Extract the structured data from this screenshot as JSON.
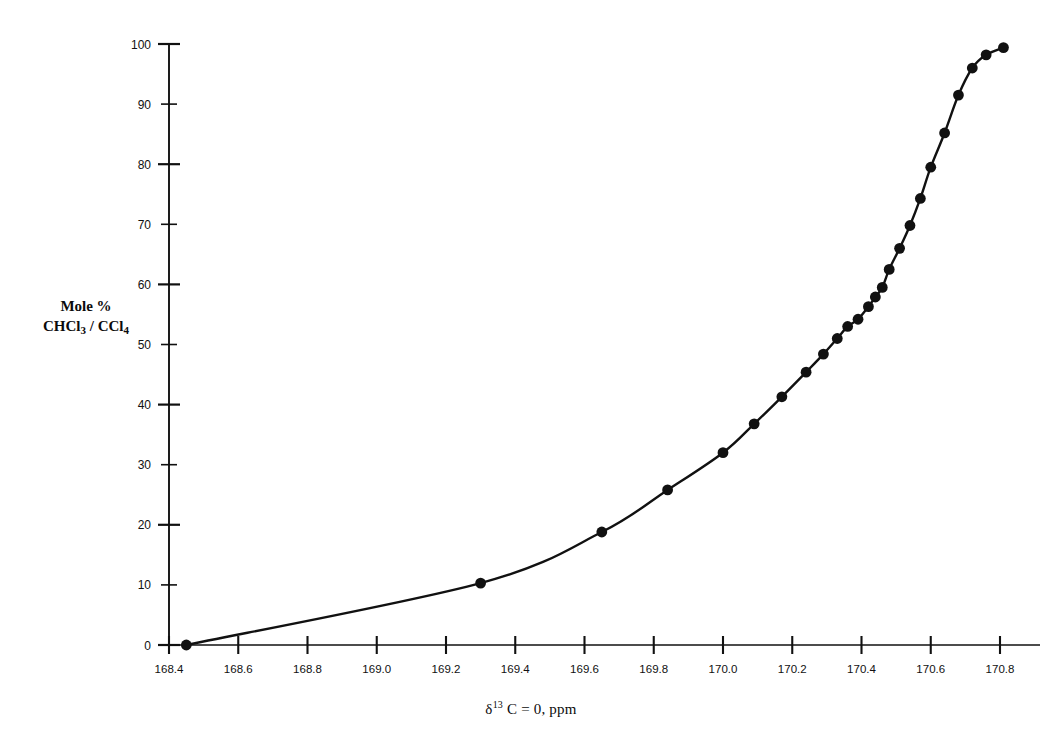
{
  "chart_data": {
    "type": "scatter",
    "title": "",
    "subtitle": "",
    "xlabel": "δ 13 C = 0, ppm",
    "xlabel_parts": {
      "delta": "δ",
      "superscript": "13",
      "rest": "C = 0, ppm"
    },
    "ylabel": "Mole % CHCl3 / CCl4",
    "ylabel_lines": [
      "Mole %",
      "CHCl3 / CCl4"
    ],
    "ylabel_line1": "Mole %",
    "ylabel_line2_a": "CHCl",
    "ylabel_line2_sub1": "3",
    "ylabel_line2_b": " / CCl",
    "ylabel_line2_sub2": "4",
    "xlim": [
      168.4,
      170.85
    ],
    "ylim": [
      0,
      100
    ],
    "xticks": [
      168.4,
      168.6,
      168.8,
      169.0,
      169.2,
      169.4,
      169.6,
      169.8,
      170.0,
      170.2,
      170.4,
      170.6,
      170.8
    ],
    "xticklabels": [
      "168.4",
      "168.6",
      "168.8",
      "169.0",
      "169.2",
      "169.4",
      "169.6",
      "169.8",
      "170.0",
      "170.2",
      "170.4",
      "170.6",
      "170.8"
    ],
    "yticks": [
      0,
      10,
      20,
      30,
      40,
      50,
      60,
      70,
      80,
      90,
      100
    ],
    "yticklabels": [
      "0",
      "10",
      "20",
      "30",
      "40",
      "50",
      "60",
      "70",
      "80",
      "90",
      "100"
    ],
    "grid": false,
    "legend": false,
    "legend_position": "none",
    "marker": "filled-circle",
    "marker_color": "#111111",
    "line_color": "#111111",
    "line_style": "solid",
    "x": [
      168.45,
      169.3,
      169.65,
      169.84,
      170.0,
      170.09,
      170.17,
      170.24,
      170.29,
      170.33,
      170.36,
      170.39,
      170.42,
      170.44,
      170.46,
      170.48,
      170.51,
      170.54,
      170.57,
      170.6,
      170.64,
      170.68,
      170.72,
      170.76,
      170.81
    ],
    "y": [
      0.0,
      10.3,
      18.8,
      25.8,
      32.0,
      36.8,
      41.3,
      45.4,
      48.4,
      51.0,
      53.0,
      54.2,
      56.3,
      57.9,
      59.5,
      62.5,
      66.0,
      69.8,
      74.3,
      79.5,
      85.2,
      91.5,
      96.0,
      98.2,
      99.4
    ],
    "n_points": 25,
    "points": [
      {
        "x": 168.45,
        "y": 0.0
      },
      {
        "x": 169.3,
        "y": 10.3
      },
      {
        "x": 169.65,
        "y": 18.8
      },
      {
        "x": 169.84,
        "y": 25.8
      },
      {
        "x": 170.0,
        "y": 32.0
      },
      {
        "x": 170.09,
        "y": 36.8
      },
      {
        "x": 170.17,
        "y": 41.3
      },
      {
        "x": 170.24,
        "y": 45.4
      },
      {
        "x": 170.29,
        "y": 48.4
      },
      {
        "x": 170.33,
        "y": 51.0
      },
      {
        "x": 170.36,
        "y": 53.0
      },
      {
        "x": 170.39,
        "y": 54.2
      },
      {
        "x": 170.42,
        "y": 56.3
      },
      {
        "x": 170.44,
        "y": 57.9
      },
      {
        "x": 170.46,
        "y": 59.5
      },
      {
        "x": 170.48,
        "y": 62.5
      },
      {
        "x": 170.51,
        "y": 66.0
      },
      {
        "x": 170.54,
        "y": 69.8
      },
      {
        "x": 170.57,
        "y": 74.3
      },
      {
        "x": 170.6,
        "y": 79.5
      },
      {
        "x": 170.64,
        "y": 85.2
      },
      {
        "x": 170.68,
        "y": 91.5
      },
      {
        "x": 170.72,
        "y": 96.0
      },
      {
        "x": 170.76,
        "y": 98.2
      },
      {
        "x": 170.81,
        "y": 99.4
      }
    ]
  },
  "colors": {
    "background": "#ffffff",
    "ink": "#111111",
    "axis": "#111111"
  }
}
